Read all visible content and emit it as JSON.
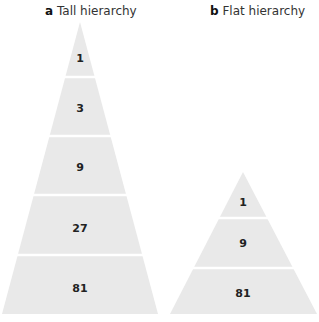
{
  "panels": [
    {
      "letter": "a",
      "title": "Tall hierarchy",
      "levels": [
        "1",
        "3",
        "9",
        "27",
        "81"
      ]
    },
    {
      "letter": "b",
      "title": "Flat hierarchy",
      "levels": [
        "1",
        "9",
        "81"
      ]
    }
  ],
  "colors": {
    "fill": "#e9e9e9",
    "separator": "#ffffff",
    "text": "#222222"
  }
}
